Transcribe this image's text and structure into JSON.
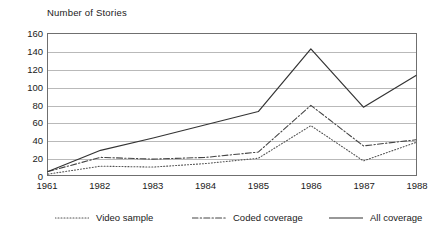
{
  "chart_data": {
    "type": "line",
    "title": "Number of Stories",
    "xlabel": "",
    "ylabel": "Number of Stories",
    "ylim": [
      0,
      160
    ],
    "yticks": [
      0,
      20,
      40,
      60,
      80,
      100,
      120,
      140,
      160
    ],
    "ytick_labels": [
      "0",
      "20",
      "40",
      "60",
      "80",
      "100",
      "120",
      "140",
      "160"
    ],
    "grid": "horizontal",
    "legend_position": "bottom",
    "categories": [
      "1961",
      "1982",
      "1983",
      "1984",
      "1985",
      "1986",
      "1987",
      "1988"
    ],
    "x": [
      "1961",
      "1982",
      "1983",
      "1984",
      "1985",
      "1986",
      "1987",
      "1988"
    ],
    "series": [
      {
        "name": "Video sample",
        "style": "dotted",
        "color": "#555555",
        "values": [
          1,
          10,
          9,
          13,
          19,
          56,
          16,
          37
        ]
      },
      {
        "name": "Coded coverage",
        "style": "dash-dot",
        "color": "#444444",
        "values": [
          4,
          20,
          18,
          20,
          26,
          79,
          33,
          40
        ]
      },
      {
        "name": "All coverage",
        "style": "solid",
        "color": "#333333",
        "values": [
          4,
          28,
          42,
          57,
          72,
          143,
          77,
          113
        ]
      }
    ]
  },
  "legend": {
    "items": [
      {
        "label": "Video sample"
      },
      {
        "label": "Coded coverage"
      },
      {
        "label": "All coverage"
      }
    ]
  }
}
